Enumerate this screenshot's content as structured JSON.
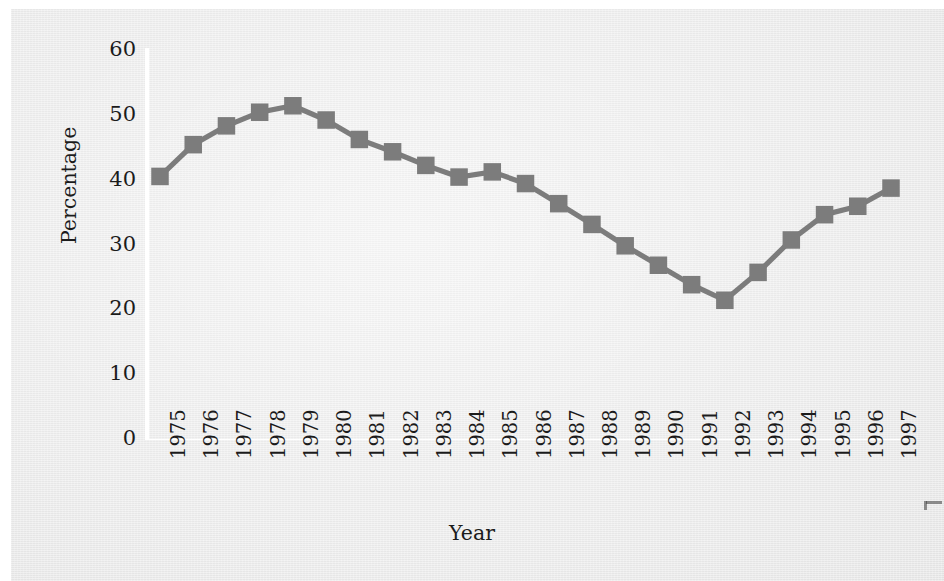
{
  "figure": {
    "background_color": "#ececec",
    "ink_color": "#1b1b1b",
    "axis_color": "#ffffff",
    "series_color": "#7c7c7c"
  },
  "axes": {
    "ylabel": "Percentage",
    "xlabel": "Year",
    "ytick_labels": [
      "0",
      "10",
      "20",
      "30",
      "40",
      "50",
      "60"
    ],
    "xtick_labels": [
      "1975",
      "1976",
      "1977",
      "1978",
      "1979",
      "1980",
      "1981",
      "1982",
      "1983",
      "1984",
      "1985",
      "1986",
      "1987",
      "1988",
      "1989",
      "1990",
      "1991",
      "1992",
      "1993",
      "1994",
      "1995",
      "1996",
      "1997"
    ]
  },
  "chart_data": {
    "type": "line",
    "title": "",
    "xlabel": "Year",
    "ylabel": "Percentage",
    "xlim": [
      1974.3,
      1997.7
    ],
    "ylim": [
      0,
      60
    ],
    "yticks": [
      0,
      10,
      20,
      30,
      40,
      50,
      60
    ],
    "grid": false,
    "legend": null,
    "marker": "square",
    "marker_color": "#7c7c7c",
    "line_color": "#7c7c7c",
    "x": [
      1975,
      1976,
      1977,
      1978,
      1979,
      1980,
      1981,
      1982,
      1983,
      1984,
      1985,
      1986,
      1987,
      1988,
      1989,
      1990,
      1991,
      1992,
      1993,
      1994,
      1995,
      1996,
      1997
    ],
    "categories": [
      "1975",
      "1976",
      "1977",
      "1978",
      "1979",
      "1980",
      "1981",
      "1982",
      "1983",
      "1984",
      "1985",
      "1986",
      "1987",
      "1988",
      "1989",
      "1990",
      "1991",
      "1992",
      "1993",
      "1994",
      "1995",
      "1996",
      "1997"
    ],
    "values": [
      40.5,
      45.4,
      48.3,
      50.4,
      51.4,
      49.2,
      46.2,
      44.3,
      42.2,
      40.4,
      41.2,
      39.4,
      36.3,
      33.1,
      29.8,
      26.8,
      23.8,
      21.4,
      25.7,
      30.7,
      34.6,
      35.9,
      38.7
    ],
    "series": [
      {
        "name": "Percentage",
        "values": [
          40.5,
          45.4,
          48.3,
          50.4,
          51.4,
          49.2,
          46.2,
          44.3,
          42.2,
          40.4,
          41.2,
          39.4,
          36.3,
          33.1,
          29.8,
          26.8,
          23.8,
          21.4,
          25.7,
          30.7,
          34.6,
          35.9,
          38.7
        ]
      }
    ]
  }
}
